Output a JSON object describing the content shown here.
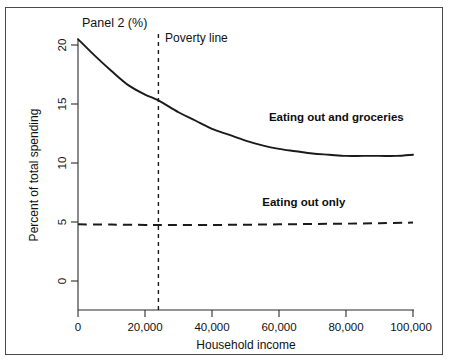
{
  "panel": {
    "title": "Panel 2 (%)"
  },
  "chart_data": {
    "type": "line",
    "title": "Panel 2 (%)",
    "xlabel": "Household income",
    "ylabel": "Percent of total spending",
    "xlim": [
      0,
      100000
    ],
    "ylim": [
      0,
      21.5
    ],
    "grid": false,
    "legend_position": "inline-annotations",
    "xticks": [
      0,
      20000,
      40000,
      60000,
      80000,
      100000
    ],
    "xticklabels": [
      "0",
      "20,000",
      "40,000",
      "60,000",
      "80,000",
      "100,000"
    ],
    "yticks": [
      0,
      5,
      10,
      15,
      20
    ],
    "yticklabels": [
      "0",
      "5",
      "10",
      "15",
      "20"
    ],
    "series": [
      {
        "name": "Eating out and groceries",
        "style": "solid",
        "label_x": 57000,
        "label_y": 13.6,
        "x": [
          0,
          5000,
          10000,
          15000,
          20000,
          24000,
          30000,
          35000,
          40000,
          45000,
          50000,
          55000,
          60000,
          65000,
          70000,
          75000,
          80000,
          85000,
          90000,
          95000,
          100000
        ],
        "y": [
          20.5,
          19.1,
          17.8,
          16.6,
          15.8,
          15.3,
          14.3,
          13.6,
          12.9,
          12.4,
          11.9,
          11.5,
          11.2,
          11.0,
          10.8,
          10.7,
          10.6,
          10.6,
          10.6,
          10.6,
          10.7
        ]
      },
      {
        "name": "Eating out only",
        "style": "dashed",
        "label_x": 55000,
        "label_y": 6.4,
        "x": [
          0,
          10000,
          20000,
          24000,
          30000,
          40000,
          50000,
          60000,
          70000,
          80000,
          90000,
          100000
        ],
        "y": [
          4.8,
          4.78,
          4.75,
          4.74,
          4.74,
          4.75,
          4.77,
          4.8,
          4.83,
          4.86,
          4.9,
          4.95
        ]
      }
    ],
    "annotations": [
      {
        "name": "poverty-line",
        "label": "Poverty line",
        "x": 24000,
        "style": "vertical-dashed",
        "label_x": 26000,
        "label_y": 20.3
      }
    ]
  },
  "labels": {
    "y_axis_title": "Percent of total spending",
    "x_axis_title": "Household income",
    "series_solid": "Eating out and groceries",
    "series_dashed": "Eating out only",
    "poverty_line": "Poverty line",
    "ytick_0": "0",
    "ytick_5": "5",
    "ytick_10": "10",
    "ytick_15": "15",
    "ytick_20": "20",
    "xtick_0": "0",
    "xtick_20k": "20,000",
    "xtick_40k": "40,000",
    "xtick_60k": "60,000",
    "xtick_80k": "80,000",
    "xtick_100k": "100,000"
  },
  "colors": {
    "line": "#1a1a1a",
    "axis": "#2b2b2b",
    "frame": "#4a4a4a",
    "background": "#ffffff"
  }
}
